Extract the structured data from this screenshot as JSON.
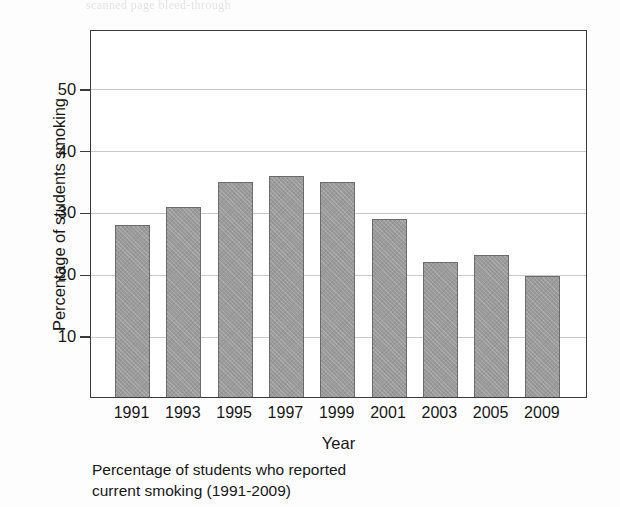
{
  "figure": {
    "bleed_text": "scanned page bleed-through",
    "caption_line1": "Percentage of students who reported",
    "caption_line2": "current smoking (1991-2009)"
  },
  "chart_data": {
    "type": "bar",
    "title": "",
    "xlabel": "Year",
    "ylabel": "Percentage of students smoking",
    "categories": [
      "1991",
      "1993",
      "1995",
      "1997",
      "1999",
      "2001",
      "2003",
      "2005",
      "2009"
    ],
    "values": [
      27.8,
      30.7,
      34.7,
      35.7,
      34.7,
      28.8,
      21.8,
      23.0,
      19.5
    ],
    "ylim": [
      0,
      59.5
    ],
    "yticks": [
      10,
      20,
      30,
      40,
      50
    ],
    "ytick_labels": [
      "10",
      "20",
      "30",
      "40",
      "50"
    ],
    "grid": true,
    "legend": false,
    "bar_color": "#9b9b9b",
    "bar_edge_color": "#6b6b6b",
    "axis_color": "#3a3a3a",
    "grid_color": "#c9c9c9"
  }
}
